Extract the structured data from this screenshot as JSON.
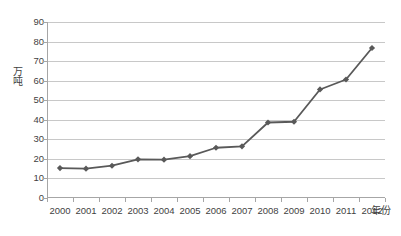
{
  "chart_data": {
    "type": "line",
    "title": "",
    "xlabel": "年份",
    "ylabel": "万吨",
    "categories": [
      "2000",
      "2001",
      "2002",
      "2003",
      "2004",
      "2005",
      "2006",
      "2007",
      "2008",
      "2009",
      "2010",
      "2011",
      "2012"
    ],
    "values": [
      15.3,
      15.0,
      16.5,
      19.8,
      19.6,
      21.4,
      25.7,
      26.4,
      38.6,
      39.0,
      55.5,
      60.6,
      76.7
    ],
    "series": [
      {
        "name": "",
        "values": [
          15.3,
          15.0,
          16.5,
          19.8,
          19.6,
          21.4,
          25.7,
          26.4,
          38.6,
          39.0,
          55.5,
          60.6,
          76.7
        ]
      }
    ],
    "ylim": [
      0,
      90
    ],
    "ytick_values": [
      0,
      10,
      20,
      30,
      40,
      50,
      60,
      70,
      80,
      90
    ],
    "ytick_labels": [
      "0",
      "10",
      "20",
      "30",
      "40",
      "50",
      "60",
      "70",
      "80",
      "90"
    ],
    "grid": true,
    "legend": false,
    "legend_position": "none",
    "marker": "diamond",
    "line_color": "#595959",
    "marker_color": "#595959",
    "grid_color": "#c8c8c8",
    "axis_color": "#a6a6a6",
    "text_color": "#3f3f3f",
    "background_color": "#ffffff"
  }
}
